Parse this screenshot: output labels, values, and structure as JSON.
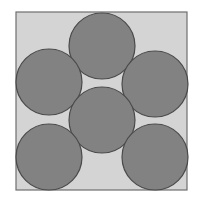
{
  "diagram": {
    "type": "circle-packing",
    "canvas": {
      "width": 198,
      "height": 202,
      "background": "#ffffff"
    },
    "square": {
      "x": 16,
      "y": 12,
      "width": 171,
      "height": 178,
      "fill": "#d4d4d4",
      "stroke": "#6e6e6e",
      "stroke_width": 1.2
    },
    "circle_style": {
      "fill": "#828282",
      "stroke": "#4a4a4a",
      "stroke_width": 1.2
    },
    "circles": [
      {
        "id": "top-center",
        "cx": 102,
        "cy": 46,
        "r": 33
      },
      {
        "id": "middle-left",
        "cx": 49,
        "cy": 82,
        "r": 33
      },
      {
        "id": "middle-right",
        "cx": 155,
        "cy": 84,
        "r": 33
      },
      {
        "id": "center",
        "cx": 102,
        "cy": 120,
        "r": 33
      },
      {
        "id": "bottom-left",
        "cx": 49,
        "cy": 157,
        "r": 33
      },
      {
        "id": "bottom-right",
        "cx": 155,
        "cy": 157,
        "r": 33
      }
    ]
  }
}
